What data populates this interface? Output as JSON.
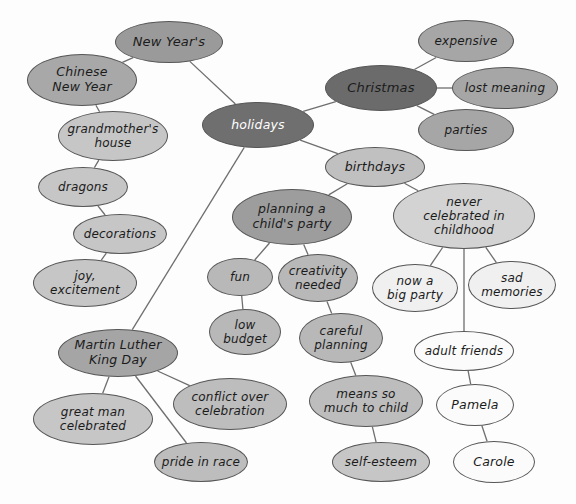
{
  "diagram": {
    "type": "mind-map",
    "background": "#fdfdfd",
    "edge_color": "#6e6e6e",
    "palette": {
      "darkest": "#6b6b6b",
      "dark": "#8f8f8f",
      "medium": "#a9a9a9",
      "light": "#c4c4c4",
      "lighter": "#d6d6d6",
      "white": "#fbfbfb"
    },
    "nodes": [
      {
        "id": "new-years",
        "label": "New Year's",
        "cx": 169,
        "cy": 42,
        "rx": 54,
        "ry": 21,
        "fill": "#9a9a9a",
        "text": "#1b1b1b",
        "size": 13
      },
      {
        "id": "chinese-new-year",
        "label": "Chinese\nNew Year",
        "cx": 82,
        "cy": 80,
        "rx": 55,
        "ry": 26,
        "fill": "#a8a8a8",
        "text": "#1b1b1b",
        "size": 12.5
      },
      {
        "id": "holidays",
        "label": "holidays",
        "cx": 258,
        "cy": 125,
        "rx": 56,
        "ry": 23,
        "fill": "#6f6f6f",
        "text": "#ffffff",
        "size": 12.5
      },
      {
        "id": "christmas",
        "label": "Christmas",
        "cx": 381,
        "cy": 88,
        "rx": 56,
        "ry": 23,
        "fill": "#6b6b6b",
        "text": "#1b1b1b",
        "size": 13
      },
      {
        "id": "expensive",
        "label": "expensive",
        "cx": 466,
        "cy": 41,
        "rx": 48,
        "ry": 21,
        "fill": "#a6a6a6",
        "text": "#1b1b1b",
        "size": 12
      },
      {
        "id": "lost-meaning",
        "label": "lost meaning",
        "cx": 505,
        "cy": 88,
        "rx": 53,
        "ry": 21,
        "fill": "#a6a6a6",
        "text": "#1b1b1b",
        "size": 12
      },
      {
        "id": "parties",
        "label": "parties",
        "cx": 466,
        "cy": 130,
        "rx": 48,
        "ry": 21,
        "fill": "#a6a6a6",
        "text": "#1b1b1b",
        "size": 12
      },
      {
        "id": "grandmothers-house",
        "label": "grandmother's\nhouse",
        "cx": 113,
        "cy": 136,
        "rx": 55,
        "ry": 25,
        "fill": "#c6c6c6",
        "text": "#1b1b1b",
        "size": 12
      },
      {
        "id": "dragons",
        "label": "dragons",
        "cx": 83,
        "cy": 187,
        "rx": 45,
        "ry": 20,
        "fill": "#c6c6c6",
        "text": "#1b1b1b",
        "size": 12
      },
      {
        "id": "decorations",
        "label": "decorations",
        "cx": 120,
        "cy": 234,
        "rx": 47,
        "ry": 20,
        "fill": "#c6c6c6",
        "text": "#1b1b1b",
        "size": 12
      },
      {
        "id": "joy-excitement",
        "label": "joy,\nexcitement",
        "cx": 85,
        "cy": 283,
        "rx": 52,
        "ry": 24,
        "fill": "#c6c6c6",
        "text": "#1b1b1b",
        "size": 12
      },
      {
        "id": "birthdays",
        "label": "birthdays",
        "cx": 375,
        "cy": 167,
        "rx": 50,
        "ry": 20,
        "fill": "#c0c0c0",
        "text": "#1b1b1b",
        "size": 12.5
      },
      {
        "id": "planning-party",
        "label": "planning a\nchild's party",
        "cx": 292,
        "cy": 217,
        "rx": 60,
        "ry": 28,
        "fill": "#9d9d9d",
        "text": "#1b1b1b",
        "size": 12.5
      },
      {
        "id": "never-celebrated",
        "label": "never\ncelebrated in\nchildhood",
        "cx": 464,
        "cy": 216,
        "rx": 71,
        "ry": 33,
        "fill": "#d3d3d3",
        "text": "#1b1b1b",
        "size": 12
      },
      {
        "id": "fun",
        "label": "fun",
        "cx": 240,
        "cy": 277,
        "rx": 33,
        "ry": 19,
        "fill": "#b8b8b8",
        "text": "#1b1b1b",
        "size": 12
      },
      {
        "id": "creativity-needed",
        "label": "creativity\nneeded",
        "cx": 318,
        "cy": 278,
        "rx": 40,
        "ry": 24,
        "fill": "#b8b8b8",
        "text": "#1b1b1b",
        "size": 12
      },
      {
        "id": "now-a-big-party",
        "label": "now a\nbig party",
        "cx": 415,
        "cy": 288,
        "rx": 43,
        "ry": 24,
        "fill": "#f0f0f0",
        "text": "#1b1b1b",
        "size": 12
      },
      {
        "id": "sad-memories",
        "label": "sad\nmemories",
        "cx": 512,
        "cy": 285,
        "rx": 44,
        "ry": 24,
        "fill": "#f0f0f0",
        "text": "#1b1b1b",
        "size": 12
      },
      {
        "id": "low-budget",
        "label": "low\nbudget",
        "cx": 245,
        "cy": 332,
        "rx": 36,
        "ry": 23,
        "fill": "#b8b8b8",
        "text": "#1b1b1b",
        "size": 12
      },
      {
        "id": "careful-planning",
        "label": "careful\nplanning",
        "cx": 341,
        "cy": 338,
        "rx": 42,
        "ry": 25,
        "fill": "#b8b8b8",
        "text": "#1b1b1b",
        "size": 12
      },
      {
        "id": "adult-friends",
        "label": "adult friends",
        "cx": 464,
        "cy": 351,
        "rx": 50,
        "ry": 20,
        "fill": "#fbfbfb",
        "text": "#1b1b1b",
        "size": 12
      },
      {
        "id": "mlk-day",
        "label": "Martin Luther\nKing Day",
        "cx": 118,
        "cy": 353,
        "rx": 60,
        "ry": 24,
        "fill": "#a5a5a5",
        "text": "#1b1b1b",
        "size": 12.5
      },
      {
        "id": "conflict-over",
        "label": "conflict over\ncelebration",
        "cx": 230,
        "cy": 404,
        "rx": 57,
        "ry": 26,
        "fill": "#bdbdbd",
        "text": "#1b1b1b",
        "size": 12
      },
      {
        "id": "means-so-much",
        "label": "means so\nmuch to child",
        "cx": 366,
        "cy": 401,
        "rx": 57,
        "ry": 26,
        "fill": "#bdbdbd",
        "text": "#1b1b1b",
        "size": 12
      },
      {
        "id": "pamela",
        "label": "Pamela",
        "cx": 475,
        "cy": 405,
        "rx": 39,
        "ry": 21,
        "fill": "#fbfbfb",
        "text": "#1b1b1b",
        "size": 12.5
      },
      {
        "id": "great-man",
        "label": "great man\ncelebrated",
        "cx": 93,
        "cy": 419,
        "rx": 60,
        "ry": 26,
        "fill": "#c6c6c6",
        "text": "#1b1b1b",
        "size": 12
      },
      {
        "id": "pride-in-race",
        "label": "pride in race",
        "cx": 201,
        "cy": 462,
        "rx": 47,
        "ry": 20,
        "fill": "#bdbdbd",
        "text": "#1b1b1b",
        "size": 12
      },
      {
        "id": "self-esteem",
        "label": "self-esteem",
        "cx": 381,
        "cy": 462,
        "rx": 49,
        "ry": 20,
        "fill": "#c6c6c6",
        "text": "#1b1b1b",
        "size": 12
      },
      {
        "id": "carole",
        "label": "Carole",
        "cx": 494,
        "cy": 462,
        "rx": 41,
        "ry": 21,
        "fill": "#fbfbfb",
        "text": "#1b1b1b",
        "size": 12.5
      }
    ],
    "edges": [
      {
        "from": "new-years",
        "to": "chinese-new-year"
      },
      {
        "from": "new-years",
        "to": "holidays"
      },
      {
        "from": "chinese-new-year",
        "to": "grandmothers-house"
      },
      {
        "from": "grandmothers-house",
        "to": "dragons"
      },
      {
        "from": "dragons",
        "to": "decorations"
      },
      {
        "from": "decorations",
        "to": "joy-excitement"
      },
      {
        "from": "holidays",
        "to": "christmas"
      },
      {
        "from": "holidays",
        "to": "birthdays"
      },
      {
        "from": "holidays",
        "to": "mlk-day"
      },
      {
        "from": "christmas",
        "to": "expensive"
      },
      {
        "from": "christmas",
        "to": "lost-meaning"
      },
      {
        "from": "christmas",
        "to": "parties"
      },
      {
        "from": "birthdays",
        "to": "planning-party"
      },
      {
        "from": "birthdays",
        "to": "never-celebrated"
      },
      {
        "from": "planning-party",
        "to": "fun"
      },
      {
        "from": "planning-party",
        "to": "creativity-needed"
      },
      {
        "from": "fun",
        "to": "low-budget"
      },
      {
        "from": "creativity-needed",
        "to": "careful-planning"
      },
      {
        "from": "careful-planning",
        "to": "means-so-much"
      },
      {
        "from": "means-so-much",
        "to": "self-esteem"
      },
      {
        "from": "never-celebrated",
        "to": "now-a-big-party"
      },
      {
        "from": "never-celebrated",
        "to": "sad-memories"
      },
      {
        "from": "never-celebrated",
        "to": "adult-friends"
      },
      {
        "from": "adult-friends",
        "to": "pamela"
      },
      {
        "from": "pamela",
        "to": "carole"
      },
      {
        "from": "mlk-day",
        "to": "great-man"
      },
      {
        "from": "mlk-day",
        "to": "pride-in-race"
      },
      {
        "from": "mlk-day",
        "to": "conflict-over"
      }
    ]
  }
}
